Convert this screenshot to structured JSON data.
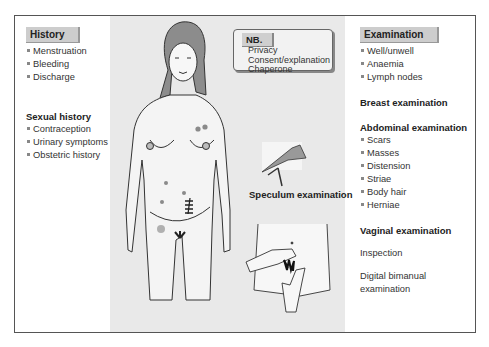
{
  "history": {
    "title": "History",
    "items": [
      "Menstruation",
      "Bleeding",
      "Discharge"
    ]
  },
  "sexual_history": {
    "title": "Sexual history",
    "items": [
      "Contraception",
      "Urinary symptoms",
      "Obstetric history"
    ]
  },
  "nb": {
    "title": "NB.",
    "items": [
      "Privacy",
      "Consent/explanation",
      "Chaperone"
    ]
  },
  "examination": {
    "title": "Examination",
    "items": [
      "Well/unwell",
      "Anaemia",
      "Lymph nodes"
    ]
  },
  "breast_examination": {
    "title": "Breast examination"
  },
  "abdominal_examination": {
    "title": "Abdominal examination",
    "items": [
      "Scars",
      "Masses",
      "Distension",
      "Striae",
      "Body hair",
      "Herniae"
    ]
  },
  "vaginal_examination": {
    "title": "Vaginal examination",
    "steps": [
      "Inspection",
      "Digital bimanual examination"
    ]
  },
  "speculum": {
    "label": "Speculum examination"
  },
  "colors": {
    "panel_gray": "#e9e9e9",
    "tab_gray": "#cdcdcd",
    "mark_gray": "#8a8a8a"
  }
}
